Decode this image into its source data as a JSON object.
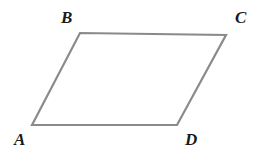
{
  "figure": {
    "kind": "parallelogram",
    "name": "parallelogram-ABCD",
    "background_color": "#ffffff",
    "stroke_color": "#8a8a8a",
    "stroke_width": 2.2,
    "fill_color": "none",
    "canvas": {
      "width": 272,
      "height": 155
    },
    "vertices": [
      {
        "id": "A",
        "label": "A",
        "x": 32,
        "y": 125,
        "label_x": 14,
        "label_y": 131
      },
      {
        "id": "B",
        "label": "B",
        "x": 80,
        "y": 33,
        "label_x": 61,
        "label_y": 9
      },
      {
        "id": "C",
        "label": "C",
        "x": 226,
        "y": 35,
        "label_x": 235,
        "label_y": 9
      },
      {
        "id": "D",
        "label": "D",
        "x": 177,
        "y": 125,
        "label_x": 185,
        "label_y": 131
      }
    ],
    "edges": [
      {
        "id": "AB",
        "from": "A",
        "to": "B"
      },
      {
        "id": "BC",
        "from": "B",
        "to": "C"
      },
      {
        "id": "CD",
        "from": "C",
        "to": "D"
      },
      {
        "id": "DA",
        "from": "D",
        "to": "A"
      }
    ],
    "label_color": "#1a1a1a",
    "label_font_size": 17
  },
  "labels": {
    "A": "A",
    "B": "B",
    "C": "C",
    "D": "D"
  }
}
